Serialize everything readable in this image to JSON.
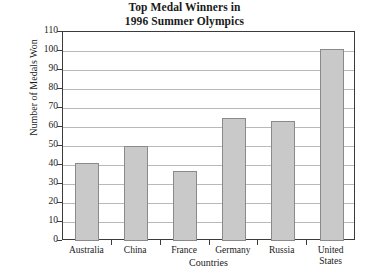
{
  "chart_data": {
    "type": "bar",
    "title": "Top Medal Winners in 1996 Summer Olympics",
    "title_lines": [
      "Top Medal Winners in",
      "1996 Summer Olympics"
    ],
    "categories": [
      "Australia",
      "China",
      "France",
      "Germany",
      "Russia",
      "United States"
    ],
    "category_lines": [
      [
        "Australia"
      ],
      [
        "China"
      ],
      [
        "France"
      ],
      [
        "Germany"
      ],
      [
        "Russia"
      ],
      [
        "United",
        "States"
      ]
    ],
    "values": [
      41,
      50,
      37,
      65,
      63,
      101
    ],
    "xlabel": "Countries",
    "ylabel": "Number of Medals Won",
    "ylim": [
      0,
      110
    ],
    "ytick_step": 10,
    "yticks": [
      0,
      10,
      20,
      30,
      40,
      50,
      60,
      70,
      80,
      90,
      100,
      110
    ],
    "ytick_labels": [
      "0",
      "10",
      "20",
      "30",
      "40",
      "50",
      "60",
      "70",
      "80",
      "90",
      "100",
      "110"
    ],
    "grid": true,
    "grid_axis": "y",
    "legend": false,
    "bar_fill_color": "#c9c9c9",
    "bar_border_color": "#8a8a8a",
    "grid_color": "#b9b9b9",
    "frame_color": "#3b3b3b",
    "background_color": "#ffffff"
  }
}
